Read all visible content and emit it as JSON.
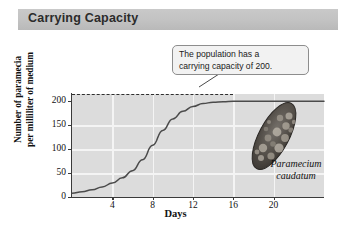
{
  "figure": {
    "title": "Carrying Capacity",
    "title_band_color": "#c2c2c2",
    "background_color": "#ffffff"
  },
  "callout": {
    "line1": "The population has a",
    "line2": "carrying capacity of 200.",
    "border_color": "#8d8d8d",
    "fill_color": "#f2f2f2"
  },
  "specimen": {
    "caption_line1": "Paramecium",
    "caption_line2": "caudatum",
    "body_color": "#4a4743"
  },
  "chart_data": {
    "type": "line",
    "title": "Carrying Capacity",
    "xlabel": "Days",
    "ylabel": "Number of paramecia per milliliter of medium",
    "ylabel_line1": "Number of paramecia",
    "ylabel_line2": "per milliliter of medium",
    "xlim": [
      0,
      25
    ],
    "ylim": [
      0,
      215
    ],
    "xticks": [
      4,
      8,
      12,
      16,
      20
    ],
    "yticks": [
      0,
      50,
      100,
      150,
      200
    ],
    "grid": true,
    "grid_color": "#f4f4f4",
    "plot_background": "#dcdcdc",
    "legend": "none",
    "curve_color": "#4b4b4b",
    "annotations": [
      {
        "type": "hline",
        "label": "carrying capacity",
        "y": 200,
        "style": "dashed",
        "color": "#2e2e2e"
      }
    ],
    "series": [
      {
        "name": "Paramecium caudatum population",
        "x": [
          0,
          1,
          2,
          3,
          4,
          5,
          6,
          7,
          8,
          9,
          10,
          11,
          12,
          13,
          14,
          15,
          16,
          17,
          18,
          19,
          20,
          21,
          22,
          23,
          24,
          25
        ],
        "values": [
          8,
          11,
          15,
          21,
          29,
          40,
          55,
          78,
          108,
          139,
          163,
          179,
          189,
          195,
          198,
          199,
          200,
          200,
          200,
          200,
          200,
          200,
          200,
          200,
          200,
          200
        ]
      }
    ]
  }
}
